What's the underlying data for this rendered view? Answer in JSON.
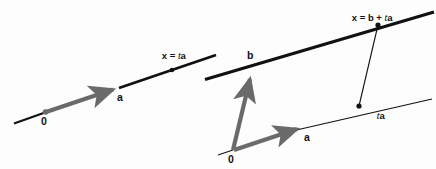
{
  "figure": {
    "background_color": "#fdfdfd",
    "ink_color": "#111111",
    "vector_color": "#6a6a6a",
    "width": 436,
    "height": 169
  },
  "left_panel": {
    "name": "line-through-origin",
    "line_equation_label": "x = ta",
    "line_equation_parts": {
      "lhs": "x",
      "equals": " = ",
      "scalar": "t",
      "vector": "a"
    },
    "origin_label": "0",
    "vector_label": "a",
    "line_start": {
      "x": 14,
      "y": 123
    },
    "line_end": {
      "x": 216,
      "y": 55
    },
    "origin_point": {
      "x": 45,
      "y": 112
    },
    "vector_a_tip": {
      "x": 119,
      "y": 89
    },
    "point_on_line": {
      "x": 172,
      "y": 70
    }
  },
  "right_panel": {
    "name": "line-offset-by-b",
    "line_equation_label": "x = b + ta",
    "line_equation_parts": {
      "lhs": "x",
      "equals": " = ",
      "offset": "b",
      "plus": " + ",
      "scalar": "t",
      "vector": "a"
    },
    "origin_label": "0",
    "vector_a_label": "a",
    "vector_b_label": "b",
    "scaled_vector_label": "ta",
    "scaled_vector_parts": {
      "scalar": "t",
      "vector": "a"
    },
    "origin_point": {
      "x": 233,
      "y": 150
    },
    "vector_a_tip": {
      "x": 303,
      "y": 127
    },
    "vector_b_tip": {
      "x": 252,
      "y": 73
    },
    "thick_line_start": {
      "x": 205,
      "y": 79
    },
    "thick_line_end": {
      "x": 434,
      "y": 12
    },
    "thin_line_start": {
      "x": 292,
      "y": 131
    },
    "thin_line_end": {
      "x": 432,
      "y": 99
    },
    "point_ta": {
      "x": 359,
      "y": 106
    },
    "point_x": {
      "x": 378,
      "y": 25
    }
  }
}
